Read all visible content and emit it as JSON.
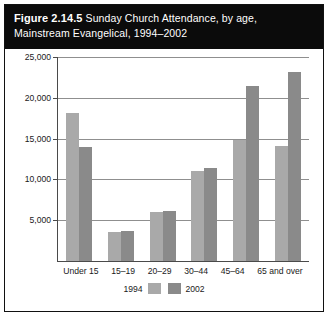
{
  "figure": {
    "number": "Figure 2.14.5",
    "title_line1": " Sunday Church Attendance, by age,",
    "title_line2": "Mainstream Evangelical, 1994–2002"
  },
  "colors": {
    "series_1994": "#a9a9a9",
    "series_2002": "#8a8a8a",
    "title_band": "#0b0b0b",
    "grid": "#8f8f8f",
    "axis": "#4a4a4a"
  },
  "chart_data": {
    "type": "bar",
    "title": "Figure 2.14.5 Sunday Church Attendance, by age, Mainstream Evangelical, 1994–2002",
    "xlabel": "",
    "ylabel": "",
    "categories": [
      "Under 15",
      "15–19",
      "20–29",
      "30–44",
      "45–64",
      "65 and over"
    ],
    "series": [
      {
        "name": "1994",
        "values": [
          18200,
          3500,
          6000,
          11000,
          14800,
          14100
        ]
      },
      {
        "name": "2002",
        "values": [
          14000,
          3700,
          6100,
          11400,
          21500,
          23200
        ]
      }
    ],
    "ylim": [
      0,
      25000
    ],
    "yticks": [
      5000,
      10000,
      15000,
      20000,
      25000
    ],
    "ytick_labels": [
      "5,000",
      "10,000",
      "15,000",
      "20,000",
      "25,000"
    ],
    "grid": true,
    "legend_position": "bottom"
  }
}
